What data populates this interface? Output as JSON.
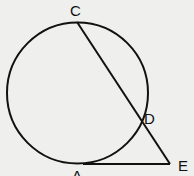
{
  "diagram": {
    "type": "geometry",
    "points": {
      "C": {
        "label": "C",
        "x": 76,
        "y": 22
      },
      "D": {
        "label": "D",
        "x": 141,
        "y": 120
      },
      "E": {
        "label": "E",
        "x": 170,
        "y": 164
      },
      "A": {
        "label": "A",
        "x": 83,
        "y": 164
      }
    },
    "circle": {
      "cx": 78,
      "cy": 93,
      "r": 71
    },
    "segments": [
      [
        "C",
        "E"
      ],
      [
        "A",
        "E"
      ]
    ],
    "stroke_color": "#111111"
  }
}
